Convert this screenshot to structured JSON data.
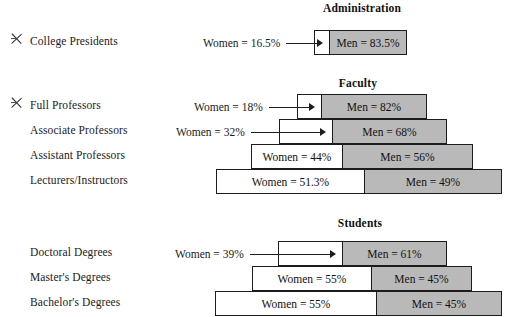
{
  "figure": {
    "type": "stacked-bar-pyramid",
    "note": "Horizontal stacked 100% bars: Women (white) on the left, Men (gray) on the right, centered as a pyramid.",
    "legend_colors": {
      "women_fill": "#ffffff",
      "men_fill": "#b9b9b9",
      "outline": "#1c1c1c"
    }
  },
  "sections": [
    {
      "title": "Administration",
      "title_center_x": 362,
      "rows": [
        {
          "label": "College Presidents",
          "annotated": true,
          "annotation_icon": "check-mark-icon",
          "women_label": "Women = 16.5%",
          "men_label": "Men = 83.5%",
          "women_value": 16.5,
          "men_value": 83.5,
          "women_label_outside": true
        }
      ]
    },
    {
      "title": "Faculty",
      "title_center_x": 358,
      "rows": [
        {
          "label": "Full Professors",
          "annotated": true,
          "annotation_icon": "check-mark-icon",
          "women_label": "Women = 18%",
          "men_label": "Men = 82%",
          "women_value": 18,
          "men_value": 82,
          "women_label_outside": true
        },
        {
          "label": "Associate Professors",
          "annotated": false,
          "women_label": "Women = 32%",
          "men_label": "Men = 68%",
          "women_value": 32,
          "men_value": 68,
          "women_label_outside": true
        },
        {
          "label": "Assistant Professors",
          "annotated": false,
          "women_label": "Women = 44%",
          "men_label": "Men = 56%",
          "women_value": 44,
          "men_value": 56,
          "women_label_outside": false
        },
        {
          "label": "Lecturers/Instructors",
          "annotated": false,
          "women_label": "Women = 51.3%",
          "men_label": "Men = 49%",
          "women_value": 51.3,
          "men_value": 49,
          "women_label_outside": false
        }
      ]
    },
    {
      "title": "Students",
      "title_center_x": 360,
      "rows": [
        {
          "label": "Doctoral Degrees",
          "annotated": false,
          "women_label": "Women = 39%",
          "men_label": "Men = 61%",
          "women_value": 39,
          "men_value": 61,
          "women_label_outside": true
        },
        {
          "label": "Master's Degrees",
          "annotated": false,
          "women_label": "Women = 55%",
          "men_label": "Men = 45%",
          "women_value": 55,
          "men_value": 45,
          "women_label_outside": false
        },
        {
          "label": "Bachelor's Degrees",
          "annotated": false,
          "women_label": "Women = 55%",
          "men_label": "Men = 45%",
          "women_value": 55,
          "men_value": 45,
          "women_label_outside": false
        }
      ]
    }
  ],
  "chart_data": {
    "type": "bar",
    "orientation": "horizontal",
    "stacked": true,
    "units": "percent",
    "xlabel": "",
    "ylabel": "",
    "xlim": [
      0,
      100
    ],
    "grid": false,
    "legend": [
      "Women",
      "Men"
    ],
    "groups": [
      "Administration",
      "Faculty",
      "Students"
    ],
    "categories": [
      "College Presidents",
      "Full Professors",
      "Associate Professors",
      "Assistant Professors",
      "Lecturers/Instructors",
      "Doctoral Degrees",
      "Master's Degrees",
      "Bachelor's Degrees"
    ],
    "series": [
      {
        "name": "Women",
        "values": [
          16.5,
          18,
          32,
          44,
          51.3,
          39,
          55,
          55
        ]
      },
      {
        "name": "Men",
        "values": [
          83.5,
          82,
          68,
          56,
          49,
          61,
          45,
          45
        ]
      }
    ],
    "annotations": [
      "Women = 16.5%",
      "Men = 83.5%",
      "Women = 18%",
      "Men = 82%",
      "Women = 32%",
      "Men = 68%",
      "Women = 44%",
      "Men = 56%",
      "Women = 51.3%",
      "Men = 49%",
      "Women = 39%",
      "Men = 61%",
      "Women = 55%",
      "Men = 45%",
      "Women = 55%",
      "Men = 45%"
    ]
  },
  "layout": {
    "rows": [
      {
        "key": "college-presidents",
        "section": 0,
        "title_y": 2,
        "bar_y": 30,
        "left": 314,
        "right": 407,
        "divider": 330,
        "label_y": 41
      },
      {
        "key": "full-professors",
        "section": 1,
        "title_y": 77,
        "bar_y": 94,
        "left": 297,
        "right": 427,
        "divider": 322,
        "label_y": 105
      },
      {
        "key": "associate-professors",
        "section": 1,
        "bar_y": 119,
        "left": 279,
        "right": 447,
        "divider": 333,
        "label_y": 130
      },
      {
        "key": "assistant-professors",
        "section": 1,
        "bar_y": 144,
        "left": 251,
        "right": 473,
        "divider": 343,
        "label_y": 155
      },
      {
        "key": "lecturers-instructors",
        "section": 1,
        "bar_y": 169,
        "left": 216,
        "right": 502,
        "divider": 365,
        "label_y": 180
      },
      {
        "key": "doctoral-degrees",
        "section": 2,
        "title_y": 217,
        "bar_y": 241,
        "left": 278,
        "right": 447,
        "divider": 343,
        "label_y": 252
      },
      {
        "key": "masters-degrees",
        "section": 2,
        "bar_y": 266,
        "left": 252,
        "right": 472,
        "divider": 372,
        "label_y": 277
      },
      {
        "key": "bachelors-degrees",
        "section": 2,
        "bar_y": 291,
        "left": 215,
        "right": 502,
        "divider": 377,
        "label_y": 302
      }
    ],
    "label_x": 30,
    "annot_x": 10
  }
}
